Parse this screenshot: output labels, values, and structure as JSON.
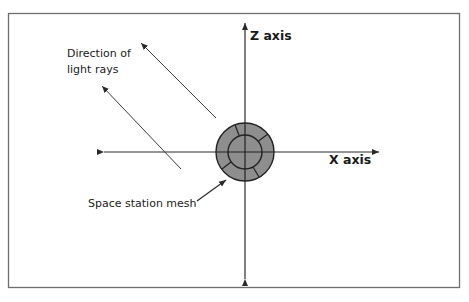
{
  "diagram": {
    "labels": {
      "light_rays_line1": "Direction of",
      "light_rays_line2": "light rays",
      "z_axis": "Z axis",
      "x_axis": "X axis",
      "mesh": "Space station mesh"
    },
    "colors": {
      "frame": "#6e6e6e",
      "lines": "#2a2a2a",
      "mesh_fill": "#8e8e8e",
      "background": "#ffffff"
    }
  }
}
